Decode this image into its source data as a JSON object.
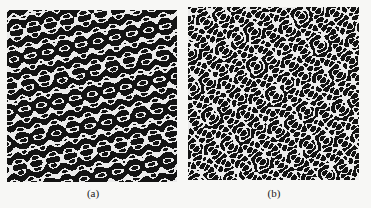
{
  "figure": {
    "panels": [
      {
        "id": "a",
        "label": "(a)",
        "symmetry": 5,
        "description": "pentagonal quasicrystalline pattern"
      },
      {
        "id": "b",
        "label": "(b)",
        "symmetry": 12,
        "description": "dodecagonal quasicrystalline pattern"
      }
    ]
  },
  "colors": {
    "dark": "#111111",
    "light": "#f0f0f0",
    "background": "#f7f7f5"
  }
}
